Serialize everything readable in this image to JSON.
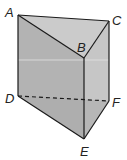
{
  "figure": {
    "vertices": {
      "A": {
        "label": "A",
        "x": 18,
        "y": 15
      },
      "B": {
        "label": "B",
        "x": 84,
        "y": 58
      },
      "C": {
        "label": "C",
        "x": 109,
        "y": 21
      },
      "D": {
        "label": "D",
        "x": 18,
        "y": 96
      },
      "E": {
        "label": "E",
        "x": 84,
        "y": 139
      },
      "F": {
        "label": "F",
        "x": 109,
        "y": 101
      }
    },
    "hidden_edges": [
      "DF"
    ],
    "colors": {
      "top_face": "#cbcbcb",
      "front_face": "#b3b3b3",
      "right_face": "#c6c6c6",
      "bottom_face": "#a9a9a9",
      "edge": "#1a1a1a"
    }
  }
}
